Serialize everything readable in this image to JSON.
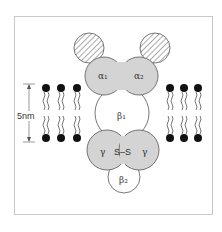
{
  "figure": {
    "scale_label": "5nm",
    "subunits": {
      "alpha1": "α₁",
      "alpha2": "α₂",
      "beta1": "β₁",
      "beta2": "β₂",
      "gamma_left": "γ",
      "gamma_right": "γ",
      "disulfide": "S–S"
    },
    "colors": {
      "gray_fill": "#d4d4d4",
      "outline": "#555555",
      "lipid_head": "#111111",
      "white_fill": "#ffffff"
    },
    "lipids": {
      "left_x": [
        46,
        61,
        77
      ],
      "right_x": [
        170,
        184,
        198
      ],
      "top_head_y": 88,
      "bottom_head_y": 138
    }
  }
}
